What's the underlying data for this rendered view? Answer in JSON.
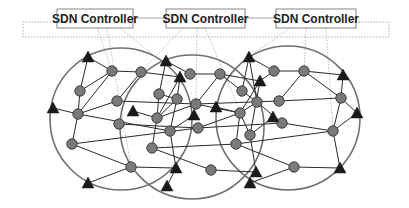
{
  "diagram": {
    "controllers": [
      {
        "id": "c1",
        "label": "SDN Controller",
        "x": 57,
        "y": 9,
        "w": 76,
        "h": 19
      },
      {
        "id": "c2",
        "label": "SDN Controller",
        "x": 166,
        "y": 9,
        "w": 79,
        "h": 19
      },
      {
        "id": "c3",
        "label": "SDN Controller",
        "x": 276,
        "y": 9,
        "w": 80,
        "h": 19
      }
    ],
    "domains": [
      {
        "cx": 121,
        "cy": 119,
        "r": 71
      },
      {
        "cx": 192,
        "cy": 127,
        "r": 72
      },
      {
        "cx": 288,
        "cy": 118,
        "r": 72
      }
    ],
    "colors": {
      "node_fill": "#7a7a7a",
      "node_stroke": "#333333",
      "triangle_fill": "#1a1a1a",
      "domain_stroke": "#707070",
      "edge": "#2a2a2a",
      "dotted": "#9a9a9a"
    }
  }
}
